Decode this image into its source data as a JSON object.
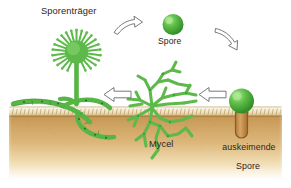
{
  "figure": {
    "language": "de",
    "width": 291,
    "height": 188
  },
  "labels": {
    "sporentraeger": "Sporenträger",
    "spore": "Spore",
    "mycel": "Mycel",
    "auskeimende_spore_line1": "auskeimende",
    "auskeimende_spore_line2": "Spore"
  },
  "icons": {
    "arrow_curved_right": "curved-arrow-right-icon",
    "arrow_curved_down_right": "curved-arrow-down-right-icon",
    "arrow_block_left_center": "block-arrow-left-icon",
    "arrow_block_left_right": "block-arrow-left-icon",
    "sporangium": "sporangium-icon",
    "spore_sphere": "spore-sphere-icon",
    "germinating_spore": "germinating-spore-icon",
    "mycelium_network": "mycelium-network-icon",
    "soil_layer": "soil-layer-icon",
    "hypha_underground": "hypha-underground-icon"
  },
  "colors": {
    "fungus_green": "#5cb94a",
    "fungus_green_dark": "#3f9c33",
    "fungus_green_light": "#86cf6e",
    "spore_highlight": "#9ede7f",
    "soil_top": "#c9a05e",
    "soil_mid": "#d8b274",
    "soil_bottom": "#f6edd2",
    "soil_surface_crust": "#f2e6c4",
    "soil_surface_line": "#8c6433",
    "germ_tube_fill": "#c9934e",
    "germ_tube_stroke": "#8a5a25",
    "arrow_outline": "#5a5a5a",
    "arrow_fill": "#ffffff",
    "text": "#2a2520",
    "background": "#ffffff"
  },
  "elements": [
    {
      "name": "sporangiophore",
      "label": "Sporenträger",
      "position": "upper-left"
    },
    {
      "name": "spore",
      "label": "Spore",
      "position": "upper-center"
    },
    {
      "name": "germinating-spore",
      "label": "auskeimende Spore",
      "position": "right"
    },
    {
      "name": "mycelium",
      "label": "Mycel",
      "position": "center-bottom"
    }
  ]
}
